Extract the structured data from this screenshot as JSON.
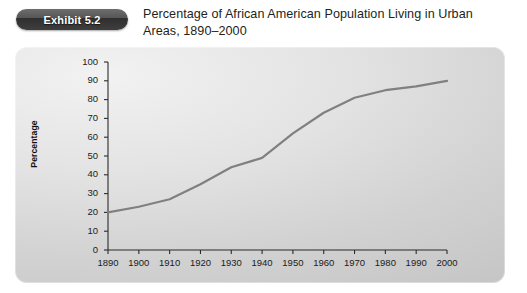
{
  "header": {
    "badge_label": "Exhibit 5.2",
    "title_line1": "Percentage of African American Population Living in Urban",
    "title_line2": "Areas, 1890–2000"
  },
  "colors": {
    "badge_dark": "#3e3e3e",
    "badge_text": "#ffffff",
    "title_text": "#231f20",
    "panel_light": "#f2f2f2",
    "panel_dark": "#c6c6c6",
    "line": "#808080",
    "axis": "#2b2b2b",
    "tick_text": "#1b1b1b"
  },
  "chart_data": {
    "type": "line",
    "title": "Percentage of African American Population Living in Urban Areas, 1890–2000",
    "xlabel": "",
    "ylabel": "Percentage",
    "x": [
      1890,
      1900,
      1910,
      1920,
      1930,
      1940,
      1950,
      1960,
      1970,
      1980,
      1990,
      2000
    ],
    "values": [
      20,
      23,
      27,
      35,
      44,
      49,
      62,
      73,
      81,
      85,
      87,
      90
    ],
    "xtick_labels": [
      "1890",
      "1900",
      "1910",
      "1920",
      "1930",
      "1940",
      "1950",
      "1960",
      "1970",
      "1980",
      "1990",
      "2000"
    ],
    "ytick_labels": [
      "0",
      "10",
      "20",
      "30",
      "40",
      "50",
      "60",
      "70",
      "80",
      "90",
      "100"
    ],
    "yticks": [
      0,
      10,
      20,
      30,
      40,
      50,
      60,
      70,
      80,
      90,
      100
    ],
    "xlim": [
      1890,
      2000
    ],
    "ylim": [
      0,
      100
    ],
    "grid": false,
    "legend": null,
    "series": [
      {
        "name": "Percentage urban",
        "values": [
          20,
          23,
          27,
          35,
          44,
          49,
          62,
          73,
          81,
          85,
          87,
          90
        ]
      }
    ]
  }
}
